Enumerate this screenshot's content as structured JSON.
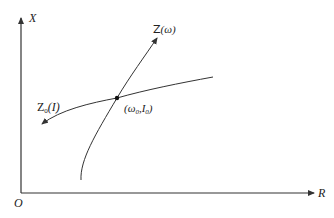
{
  "axes": {
    "y_label": "X",
    "x_label": "R",
    "origin_label": "O"
  },
  "curves": {
    "z_omega": {
      "label_main": "Z",
      "label_arg": "(ω)"
    },
    "z0_I": {
      "label_main": "Z",
      "label_sub": "0",
      "label_arg": "(I)"
    }
  },
  "intersection": {
    "label_open": "(ω",
    "label_sub1": "0",
    "label_mid": ",I",
    "label_sub2": "0",
    "label_close": ")"
  },
  "colors": {
    "stroke": "#333333",
    "background": "#ffffff"
  }
}
